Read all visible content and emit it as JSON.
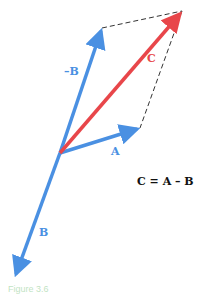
{
  "diagram": {
    "type": "vector-subtraction",
    "vectors": {
      "A": {
        "label": "A",
        "color": "#4a90e2",
        "from": [
          60,
          153
        ],
        "to": [
          140,
          128
        ]
      },
      "neg_B": {
        "label": "–B",
        "color": "#4a90e2",
        "from": [
          60,
          153
        ],
        "to": [
          102,
          28
        ]
      },
      "B": {
        "label": "B",
        "color": "#4a90e2",
        "from": [
          60,
          153
        ],
        "to": [
          15,
          277
        ]
      },
      "C": {
        "label": "C",
        "color": "#e8464a",
        "from": [
          60,
          153
        ],
        "to": [
          182,
          11
        ]
      }
    },
    "equation": "C = A – B",
    "caption": "Figure 3.6"
  },
  "colors": {
    "vector_blue": "#4a90e2",
    "vector_red": "#e8464a",
    "dashed": "#333333"
  }
}
